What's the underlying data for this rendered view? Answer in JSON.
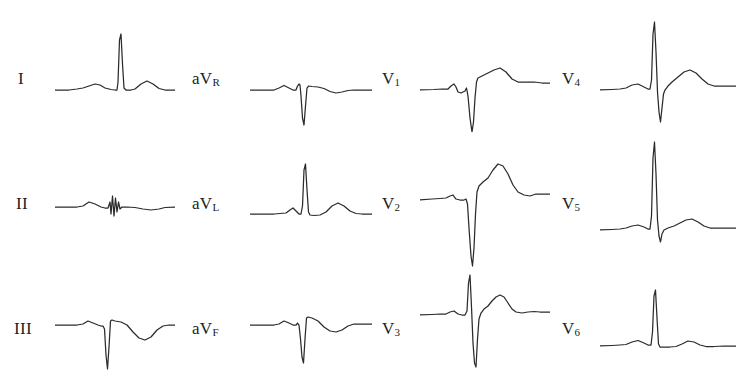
{
  "figure": {
    "kind": "12-lead-ecg",
    "clipped_top_text": "",
    "stroke_color": "#2b2b2b",
    "background_color": "#ffffff",
    "columns": 4,
    "rows": 3
  },
  "leads": [
    {
      "id": "I",
      "label_main": "I",
      "label_sub": "",
      "column": 0,
      "row": 0,
      "label_x": 18,
      "label_y": 48,
      "trace_x": 55,
      "trace_y": 0,
      "trace_w": 120,
      "trace_h": 110,
      "baseline": 68,
      "path": "M0,68 L14,68 L22,67 L28,66 L34,64 L40,62 L45,63 L50,66 L56,67.5 L60,68 L62,68 L63,60 L64.5,18 L66,12 L67.5,42 L69,66 L71,68 L76,68 L80,67 L86,62 L92,59 L98,62 L104,66.5 L110,68 L120,68"
    },
    {
      "id": "II",
      "label_main": "II",
      "label_sub": "",
      "column": 0,
      "row": 1,
      "label_x": 16,
      "label_y": 173,
      "trace_x": 55,
      "trace_y": 130,
      "trace_w": 120,
      "trace_h": 110,
      "baseline": 55,
      "path": "M0,55 L14,55 L22,55 L28,54 L34,50 L40,52 L46,55 L50,56 L53,56 L55,50 L56,62 L57.5,44 L59,64 L60.5,46 L62,60 L63.5,50 L65,57 L67,55 L72,55 L80,55.5 L88,57 L96,58 L104,57 L110,55.5 L120,55"
    },
    {
      "id": "III",
      "label_main": "III",
      "label_sub": "",
      "column": 0,
      "row": 2,
      "label_x": 14,
      "label_y": 298,
      "trace_x": 55,
      "trace_y": 255,
      "trace_w": 120,
      "trace_h": 110,
      "baseline": 48,
      "path": "M0,48 L14,48 L22,48 L28,47 L33,44 L38,46 L43,48 L46,49 L48,49 L49.5,52 L51,78 L52.5,92 L54,70 L55.5,44 L57,43 L60,44 L66,45 L72,48 L78,55 L84,61 L90,63 L96,60 L102,53 L108,49 L114,48 L120,48"
    },
    {
      "id": "aVR",
      "label_main": "aV",
      "label_sub": "R",
      "column": 1,
      "row": 0,
      "label_x": 192,
      "label_y": 48,
      "trace_x": 250,
      "trace_y": 0,
      "trace_w": 122,
      "trace_h": 110,
      "baseline": 68,
      "path": "M0,68 L16,68 L24,68 L29,66 L34,63.5 L39,66 L43,68 L46,68 L47.5,64 L49,62 L50,63 L51,74 L52.5,96 L54,103 L55.5,84 L57,66 L58.5,64 L62,64.5 L68,65 L74,66.5 L80,69.5 L86,71 L92,70 L98,68.5 L104,68 L112,68 L122,68"
    },
    {
      "id": "aVL",
      "label_main": "aV",
      "label_sub": "L",
      "column": 1,
      "row": 1,
      "label_x": 192,
      "label_y": 173,
      "trace_x": 250,
      "trace_y": 130,
      "trace_w": 122,
      "trace_h": 110,
      "baseline": 62,
      "path": "M0,62 L16,62 L24,62 L30,61.5 L36,61 L40,58 L43,56 L46,59 L49,62 L51,62 L52.5,54 L54,18 L55.5,12 L57,38 L58.5,60 L60,63 L64,63.5 L70,63 L76,60 L82,54 L88,51 L94,54 L100,59 L106,61.5 L112,62 L122,62"
    },
    {
      "id": "aVF",
      "label_main": "aV",
      "label_sub": "F",
      "column": 1,
      "row": 2,
      "label_x": 192,
      "label_y": 298,
      "trace_x": 250,
      "trace_y": 255,
      "trace_w": 122,
      "trace_h": 110,
      "baseline": 48,
      "path": "M0,48 L16,48 L24,48 L29,47 L34,44 L39,46 L43,48 L46,48 L47.5,46 L49,48 L50.5,62 L52,80 L53.5,86 L55,62 L56.5,41 L58,40 L62,41 L68,44 L74,50 L80,54 L86,55 L92,53 L98,49 L104,47 L110,47 L122,47"
    },
    {
      "id": "V1",
      "label_main": "V",
      "label_sub": "1",
      "column": 2,
      "row": 0,
      "label_x": 382,
      "label_y": 48,
      "trace_x": 420,
      "trace_y": 0,
      "trace_w": 130,
      "trace_h": 110,
      "baseline": 68,
      "path": "M0,68 L14,67.5 L22,67 L28,67 L31,64 L34,62 L36,65 L38,70 L41,71 L43,70 L45,69 L46.5,66 L48,74 L50,96 L52,110 L53.5,100 L55,76 L56.5,60 L58,56 L62,54 L68,51 L74,48 L80,46 L86,50 L92,57 L98,60 L106,60 L114,60 L122,61 L130,61"
    },
    {
      "id": "V2",
      "label_main": "V",
      "label_sub": "2",
      "column": 2,
      "row": 1,
      "label_x": 382,
      "label_y": 173,
      "trace_x": 420,
      "trace_y": 122,
      "trace_w": 130,
      "trace_h": 125,
      "baseline": 56,
      "path": "M0,56 L12,55 L20,54.5 L26,54 L30,52 L33,51 L36,55 L40,56 L44,56 L46,55 L47.5,60 L49,84 L51,112 L52.5,122 L54,104 L55.5,70 L57,48 L59,42 L63,38 L68,34 L73,26 L78,20 L83,22 L88,30 L93,41 L98,48 L104,51 L110,52 L116,50 L122,50 L130,50"
    },
    {
      "id": "V3",
      "label_main": "V",
      "label_sub": "3",
      "column": 2,
      "row": 2,
      "label_x": 382,
      "label_y": 298,
      "trace_x": 420,
      "trace_y": 245,
      "trace_w": 130,
      "trace_h": 120,
      "baseline": 48,
      "path": "M0,48 L12,47.5 L20,47 L26,47 L30,45 L34,44 L38,47 L42,48 L45,48 L47,44 L48.5,16 L50,8 L51.5,40 L53,76 L54.5,96 L56,100 L57.5,72 L59,52 L61,46 L64,42 L68,39 L72,34 L76,30 L80,28 L84,30 L88,36 L92,42 L96,45 L102,46 L108,45 L114,44.5 L120,45 L130,45"
    },
    {
      "id": "V4",
      "label_main": "V",
      "label_sub": "4",
      "column": 3,
      "row": 0,
      "label_x": 562,
      "label_y": 48,
      "trace_x": 600,
      "trace_y": -8,
      "trace_w": 136,
      "trace_h": 125,
      "baseline": 76,
      "path": "M0,76 L12,75.5 L20,75 L26,74 L32,71 L38,70 L44,73 L48,75 L50,75 L51.5,66 L53,20 L54.5,8 L56,38 L57.5,78 L59,98 L60.5,108 L62,94 L63.5,80 L65,76 L68,72 L72,68 L78,63 L84,58 L90,56 L96,59 L102,65 L108,70 L114,72 L120,72 L128,72 L136,72"
    },
    {
      "id": "V5",
      "label_main": "V",
      "label_sub": "5",
      "column": 3,
      "row": 1,
      "label_x": 562,
      "label_y": 173,
      "trace_x": 600,
      "trace_y": 112,
      "trace_w": 136,
      "trace_h": 130,
      "baseline": 96,
      "path": "M0,96 L12,95.5 L20,95 L26,94 L32,92 L38,91 L44,93 L48,95 L50,95 L51.5,82 L53,24 L54.5,8 L56,40 L57.5,86 L59,102 L60.5,108 L62,100 L64,96 L68,94 L74,92 L80,89 L86,86 L92,85 L98,88 L104,92 L110,94 L116,94 L124,94 L136,94"
    },
    {
      "id": "V6",
      "label_main": "V",
      "label_sub": "6",
      "column": 3,
      "row": 2,
      "label_x": 562,
      "label_y": 298,
      "trace_x": 600,
      "trace_y": 252,
      "trace_w": 136,
      "trace_h": 113,
      "baseline": 72,
      "path": "M0,72 L12,71.5 L20,71 L26,70.5 L32,68 L38,66.5 L44,69 L48,71 L51,71 L52.5,58 L54,22 L55.5,16 L57,44 L58.5,70 L60,73 L64,73 L70,73 L76,72.5 L82,70 L88,67 L94,68 L100,71 L106,72.5 L114,72.5 L124,72 L136,72"
    }
  ]
}
